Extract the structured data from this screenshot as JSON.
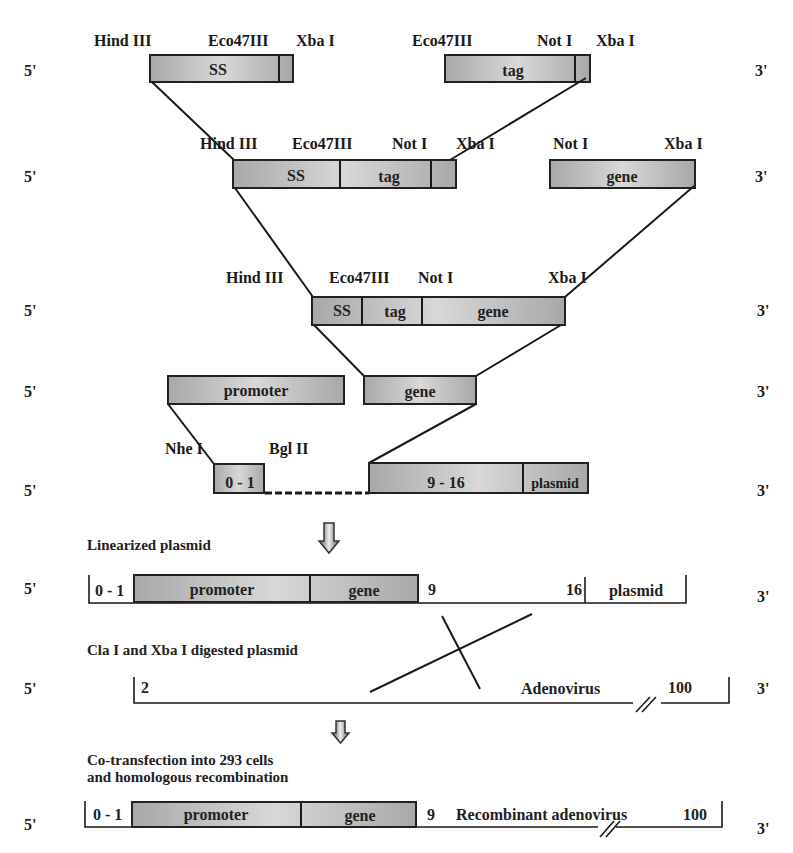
{
  "ends": {
    "five_prime": "5'",
    "three_prime": "3'"
  },
  "row1": {
    "left_sites": [
      "Hind III",
      "Eco47III",
      "Xba I"
    ],
    "right_sites": [
      "Eco47III",
      "Not I",
      "Xba I"
    ],
    "left_box": "SS",
    "right_box": "tag"
  },
  "row2": {
    "left_sites": [
      "Hind III",
      "Eco47III",
      "Not I",
      "Xba I"
    ],
    "right_sites": [
      "Not I",
      "Xba I"
    ],
    "left_segments": [
      "SS",
      "tag"
    ],
    "right_box": "gene"
  },
  "row3": {
    "sites": [
      "Hind III",
      "Eco47III",
      "Not I",
      "Xba I"
    ],
    "segments": [
      "SS",
      "tag",
      "gene"
    ]
  },
  "row4": {
    "left_box": "promoter",
    "right_box": "gene"
  },
  "row5": {
    "sites": [
      "Nhe I",
      "Bgl II"
    ],
    "left_box": "0 - 1",
    "right_segments": [
      "9 - 16",
      "plasmid"
    ]
  },
  "linearized": {
    "caption": "Linearized plasmid",
    "left_mark": "0 - 1",
    "segments": [
      "promoter",
      "gene"
    ],
    "mark_9": "9",
    "mark_16": "16",
    "plasmid": "plasmid"
  },
  "digested": {
    "caption": "Cla I and Xba I digested plasmid",
    "left_mark": "2",
    "name": "Adenovirus",
    "right_mark": "100"
  },
  "recombinant": {
    "caption_line1": "Co-transfection into 293 cells",
    "caption_line2": "and homologous recombination",
    "left_mark": "0 - 1",
    "segments": [
      "promoter",
      "gene"
    ],
    "mark_9": "9",
    "name": "Recombinant adenovirus",
    "right_mark": "100"
  },
  "icons": {
    "step_arrow": "down-arrow-icon",
    "break_mark": "double-slash-break-icon",
    "crossover": "crossover-x-icon"
  },
  "colors": {
    "box_fill_light": "#d6d6d6",
    "box_fill_dark": "#a9a9a9",
    "stroke": "#1a1a1a",
    "text": "#1a1a1a",
    "background": "#ffffff"
  }
}
